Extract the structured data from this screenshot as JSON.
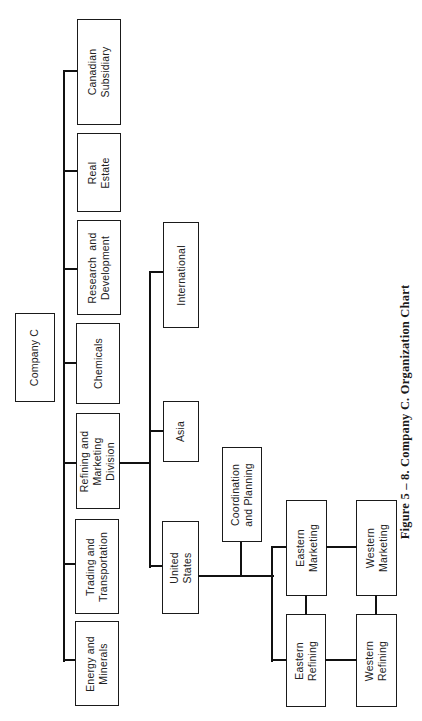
{
  "figure": {
    "caption": "Figure 5 – 8.  Company C. Organization Chart",
    "orientation": "rotated 90° counter-clockwise"
  },
  "org": {
    "root": {
      "label": "Company C"
    },
    "divisions": [
      {
        "label": "Energy and\nMinerals"
      },
      {
        "label": "Trading and\nTransportation"
      },
      {
        "label": "Refining and\nMarketing\nDivision"
      },
      {
        "label": "Chemicals"
      },
      {
        "label": "Research  and\nDevelopment"
      },
      {
        "label": "Real\nEstate"
      },
      {
        "label": "Canadian\nSubsidiary"
      }
    ],
    "rm_units": [
      {
        "label": "United\nStates"
      },
      {
        "label": "Asia"
      },
      {
        "label": "International"
      }
    ],
    "us_units": [
      {
        "label": "Coordination\nand Planning"
      },
      {
        "label": "Eastern\nRefining"
      },
      {
        "label": "Eastern\nMarketing"
      },
      {
        "label": "Western\nRefining"
      },
      {
        "label": "Western\nMarketing"
      }
    ]
  },
  "colors": {
    "line": "#111111",
    "background": "#ffffff"
  }
}
